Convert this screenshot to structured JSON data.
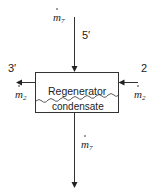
{
  "diagram": {
    "type": "control-volume",
    "component": {
      "label": "Regenerator",
      "sublabel": "condensate"
    },
    "streams": [
      {
        "state": "5′",
        "symbol": "m",
        "subscript": "7",
        "direction": "in",
        "side": "top"
      },
      {
        "state": "2",
        "symbol": "m",
        "subscript": "2",
        "direction": "in",
        "side": "right"
      },
      {
        "state": "3′",
        "symbol": "m",
        "subscript": "2",
        "direction": "out",
        "side": "left"
      },
      {
        "state": "",
        "symbol": "m",
        "subscript": "7",
        "direction": "out",
        "side": "bottom"
      }
    ]
  }
}
